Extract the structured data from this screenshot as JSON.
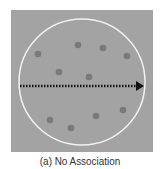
{
  "caption": "(a) No Association",
  "colors": {
    "background": "#a3a3a3",
    "circle": "#f2f2f2",
    "dot": "#7a7a7a",
    "arrow": "#111111"
  },
  "chart_data": {
    "type": "scatter",
    "title": "(a) No Association",
    "points": [
      {
        "x": 38,
        "y": 54
      },
      {
        "x": 78,
        "y": 45
      },
      {
        "x": 103,
        "y": 48
      },
      {
        "x": 127,
        "y": 56
      },
      {
        "x": 59,
        "y": 72
      },
      {
        "x": 89,
        "y": 77
      },
      {
        "x": 50,
        "y": 120
      },
      {
        "x": 71,
        "y": 128
      },
      {
        "x": 96,
        "y": 116
      },
      {
        "x": 123,
        "y": 110
      }
    ],
    "annotations": [
      "dotted horizontal arrow through center",
      "circle enclosing points"
    ]
  }
}
